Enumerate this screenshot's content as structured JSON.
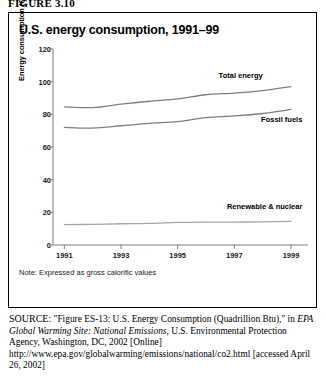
{
  "figure_label": "FIGURE 3.10",
  "chart_title": "U.S. energy consumption, 1991–99",
  "note": "Note: Expressed as gross calorific values",
  "source": {
    "prefix": "SOURCE:",
    "part1": " \"Figure ES-13: U.S. Energy Consumption (Quadrillion Btu),\" in ",
    "italic": "EPA Global Warming Site: National Emissions",
    "part2": ", U.S. Environmental Protection Agency, Washington, DC, 2002 [Online] http://www.epa.gov/globalwarming/emissions/national/co2.html [accessed April 26, 2002]"
  },
  "chart_data": {
    "type": "line",
    "title": "U.S. energy consumption, 1991–99",
    "xlabel": "",
    "ylabel": "Energy consumption (QBtu)",
    "xlim": [
      1990.6,
      1999.6
    ],
    "ylim": [
      0,
      120
    ],
    "yticks": [
      0,
      20,
      40,
      60,
      80,
      100,
      120
    ],
    "xticks": [
      1991,
      1993,
      1995,
      1997,
      1999
    ],
    "grid": false,
    "legend_position": "inline-right",
    "x": [
      1991,
      1992,
      1993,
      1994,
      1995,
      1996,
      1997,
      1998,
      1999
    ],
    "series": [
      {
        "name": "Total energy",
        "values": [
          84.6,
          84.1,
          86.2,
          88.0,
          89.5,
          92.0,
          93.0,
          94.5,
          97.0
        ],
        "color": "#808080",
        "label_x": 1998.0,
        "label_y": 104.0
      },
      {
        "name": "Fossil fuels",
        "values": [
          72.0,
          71.6,
          73.0,
          74.5,
          75.5,
          78.0,
          79.0,
          80.5,
          83.0
        ],
        "color": "#808080",
        "label_x": 1999.4,
        "label_y": 77.0
      },
      {
        "name": "Renewable & nuclear",
        "values": [
          12.5,
          12.6,
          13.0,
          13.2,
          13.8,
          14.0,
          14.0,
          14.2,
          14.5
        ],
        "color": "#a6a6a6",
        "label_x": 1999.4,
        "label_y": 24.0
      }
    ]
  }
}
